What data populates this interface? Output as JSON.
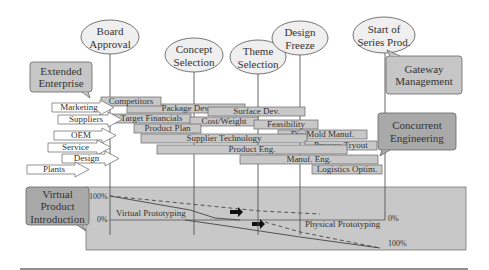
{
  "milestones": [
    {
      "id": "board-approval",
      "lines": [
        "Board",
        "Approval"
      ],
      "cx": 110,
      "cy": 37,
      "rx": 29,
      "ry": 17,
      "line_x": 110
    },
    {
      "id": "concept-selection",
      "lines": [
        "Concept",
        "Selection"
      ],
      "cx": 194,
      "cy": 55,
      "rx": 29,
      "ry": 17,
      "line_x": 194
    },
    {
      "id": "theme-selection",
      "lines": [
        "Theme",
        "Selection"
      ],
      "cx": 258,
      "cy": 57,
      "rx": 28,
      "ry": 17,
      "line_x": 258
    },
    {
      "id": "design-freeze",
      "lines": [
        "Design",
        "Freeze"
      ],
      "cx": 300,
      "cy": 38,
      "rx": 28,
      "ry": 17,
      "line_x": 300
    },
    {
      "id": "start-series-prod",
      "lines": [
        "Start of",
        "Series Prod."
      ],
      "cx": 384,
      "cy": 35,
      "rx": 31,
      "ry": 18,
      "line_x": 385
    }
  ],
  "callouts": [
    {
      "id": "extended-enterprise",
      "lines": [
        "Extended",
        "Enterprise"
      ],
      "x": 30,
      "y": 62,
      "w": 62,
      "h": 30,
      "fill": "#c6c6c6"
    },
    {
      "id": "gateway-management",
      "lines": [
        "Gateway",
        "Management"
      ],
      "x": 386,
      "y": 56,
      "w": 76,
      "h": 38,
      "fill": "#c6c6c6"
    },
    {
      "id": "concurrent-engineering",
      "lines": [
        "Concurrent",
        "Engineering"
      ],
      "x": 378,
      "y": 113,
      "w": 78,
      "h": 37,
      "fill": "#a9a9a9"
    },
    {
      "id": "virtual-product-introduction",
      "lines": [
        "Virtual",
        "Product",
        "Introduction"
      ],
      "x": 26,
      "y": 187,
      "w": 63,
      "h": 38,
      "fill": "#a9a9a9"
    }
  ],
  "partners": [
    {
      "label": "Marketing",
      "x": 52,
      "y": 103,
      "w": 48
    },
    {
      "label": "Suppliers",
      "x": 58,
      "y": 115,
      "w": 50
    },
    {
      "label": "OEM",
      "x": 54,
      "y": 131,
      "w": 48
    },
    {
      "label": "Service",
      "x": 48,
      "y": 143,
      "w": 49
    },
    {
      "label": "Design",
      "x": 62,
      "y": 154,
      "w": 43
    },
    {
      "label": "Plants",
      "x": 27,
      "y": 165,
      "w": 48
    }
  ],
  "tasks": [
    {
      "label": "Package Dev.",
      "x": 127,
      "y": 104,
      "w": 118
    },
    {
      "label": "Competitors",
      "x": 101,
      "y": 97,
      "w": 60
    },
    {
      "label": "Surface Dev.",
      "x": 208,
      "y": 107,
      "w": 97
    },
    {
      "label": "Target Financials",
      "x": 112,
      "y": 114,
      "w": 79
    },
    {
      "label": "Cost/Weight",
      "x": 190,
      "y": 117,
      "w": 68
    },
    {
      "label": "Feasibility",
      "x": 254,
      "y": 120,
      "w": 64
    },
    {
      "label": "Product Plan",
      "x": 134,
      "y": 124,
      "w": 67
    },
    {
      "label": "Die/Mold Manuf.",
      "x": 278,
      "y": 130,
      "w": 89
    },
    {
      "label": "Supplier Technology",
      "x": 141,
      "y": 134,
      "w": 166
    },
    {
      "label": "Process Tryout",
      "x": 305,
      "y": 141,
      "w": 72
    },
    {
      "label": "Product Eng.",
      "x": 157,
      "y": 145,
      "w": 190
    },
    {
      "label": "Manuf. Eng.",
      "x": 240,
      "y": 155,
      "w": 138
    },
    {
      "label": "Logistics Optim.",
      "x": 312,
      "y": 165,
      "w": 70
    }
  ],
  "prototyping_panel": {
    "x": 86,
    "y": 187,
    "w": 166,
    "h": 63,
    "fill": "#c8c8c8",
    "left_top_label": "100%",
    "left_bottom_label": "0%",
    "right_top_label": "0%",
    "right_bottom_label": "100%",
    "virtual_label": "Virtual Prototyping",
    "physical_label": "Physical Prototyping"
  },
  "colors": {
    "bar_fill": "#c8c8c8",
    "bar_stroke": "#666666",
    "line": "#555555",
    "ellipse_fill": "#efefef",
    "text": "#333333"
  }
}
